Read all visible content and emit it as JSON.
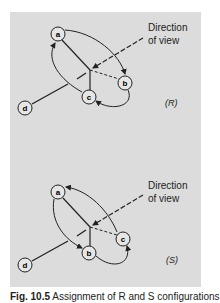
{
  "figure": {
    "background_color": "#dcdcdc",
    "line_color": "#222222",
    "node_fill": "#e6e6e6",
    "panels": [
      {
        "label": "(R)",
        "direction_label_line1": "Direction",
        "direction_label_line2": "of view",
        "nodes": [
          {
            "id": "a",
            "label": "a"
          },
          {
            "id": "b",
            "label": "b"
          },
          {
            "id": "c",
            "label": "c"
          },
          {
            "id": "d",
            "label": "d"
          }
        ]
      },
      {
        "label": "(S)",
        "direction_label_line1": "Direction",
        "direction_label_line2": "of view",
        "nodes": [
          {
            "id": "a",
            "label": "a"
          },
          {
            "id": "b",
            "label": "b"
          },
          {
            "id": "c",
            "label": "c"
          },
          {
            "id": "d",
            "label": "d"
          }
        ]
      }
    ],
    "caption_prefix": "Fig. 10.5",
    "caption_text": "Assignment of R and S configurations"
  }
}
